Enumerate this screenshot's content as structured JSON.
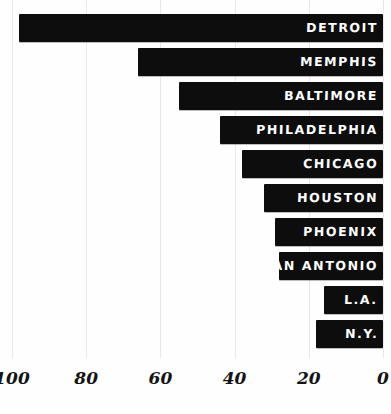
{
  "chart_data": {
    "type": "bar",
    "orientation": "horizontal",
    "title": "",
    "subtitle": "",
    "xlabel": "",
    "ylabel": "",
    "categories": [
      "DETROIT",
      "MEMPHIS",
      "BALTIMORE",
      "PHILADELPHIA",
      "CHICAGO",
      "HOUSTON",
      "PHOENIX",
      "SAN ANTONIO",
      "L.A.",
      "N.Y."
    ],
    "values": [
      98,
      66,
      55,
      44,
      38,
      32,
      29,
      28,
      16,
      18
    ],
    "xlim": [
      100,
      0
    ],
    "x_axis_reversed": true,
    "xticks": [
      100,
      80,
      60,
      40,
      20,
      0
    ],
    "xticklabels": [
      "100",
      "80",
      "60",
      "40",
      "20",
      "0"
    ],
    "grid": true,
    "grid_axis": "x",
    "legend": "none",
    "bar_color": "#0d0d0d",
    "bar_label_color": "#ffffff",
    "background_color": "#fefefe",
    "gridline_color": "#e9e9e9",
    "style": "hand-drawn",
    "bars": [
      {
        "label": "DETROIT",
        "value": 98
      },
      {
        "label": "MEMPHIS",
        "value": 66
      },
      {
        "label": "BALTIMORE",
        "value": 55
      },
      {
        "label": "PHILADELPHIA",
        "value": 44
      },
      {
        "label": "CHICAGO",
        "value": 38
      },
      {
        "label": "HOUSTON",
        "value": 32
      },
      {
        "label": "PHOENIX",
        "value": 29
      },
      {
        "label": "SAN ANTONIO",
        "value": 28
      },
      {
        "label": "L.A.",
        "value": 16
      },
      {
        "label": "N.Y.",
        "value": 18
      }
    ]
  }
}
